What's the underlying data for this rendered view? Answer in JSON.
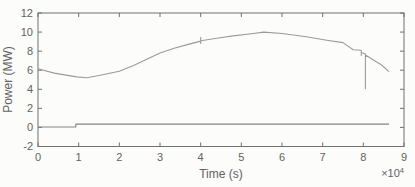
{
  "figure": {
    "background": "#fcfcfa",
    "axis_color": "#6f7173",
    "text_color": "#606264",
    "plot_box": {
      "left": 38,
      "top": 13,
      "width": 366,
      "height": 133.5
    },
    "tick_length": 4
  },
  "chart_data": {
    "type": "line",
    "title": "",
    "xlabel": "Time (s)",
    "ylabel": "Power (MW)",
    "x_multiplier_base": "×10",
    "x_multiplier_exp": "4",
    "xlim": [
      0,
      9
    ],
    "ylim": [
      -2,
      12
    ],
    "xticks": [
      0,
      1,
      2,
      3,
      4,
      5,
      6,
      7,
      8,
      9
    ],
    "yticks": [
      -2,
      0,
      2,
      4,
      6,
      8,
      10,
      12
    ],
    "grid": false,
    "legend": null,
    "series": [
      {
        "name": "upper-power-curve",
        "color": "#9b9b9b",
        "x": [
          0,
          0.4,
          0.95,
          1.2,
          1.5,
          2.0,
          2.35,
          2.7,
          3.0,
          3.35,
          3.65,
          4.0,
          4.0,
          4.0,
          4.0,
          4.4,
          4.8,
          5.3,
          5.55,
          6.0,
          6.6,
          7.1,
          7.5,
          7.75,
          7.95,
          7.95,
          7.95,
          8.05,
          8.05,
          8.05,
          8.45,
          8.63
        ],
        "y": [
          6.15,
          5.7,
          5.3,
          5.2,
          5.45,
          5.9,
          6.5,
          7.2,
          7.8,
          8.3,
          8.65,
          9.05,
          9.45,
          8.8,
          9.08,
          9.35,
          9.6,
          9.85,
          10.0,
          9.85,
          9.5,
          9.15,
          8.9,
          8.15,
          8.1,
          7.55,
          7.85,
          7.7,
          4.05,
          7.6,
          6.55,
          5.85
        ]
      },
      {
        "name": "lower-power-step",
        "color": "#848484",
        "x": [
          0,
          0.93,
          0.93,
          8.63
        ],
        "y": [
          0.05,
          0.05,
          0.35,
          0.35
        ]
      }
    ]
  }
}
